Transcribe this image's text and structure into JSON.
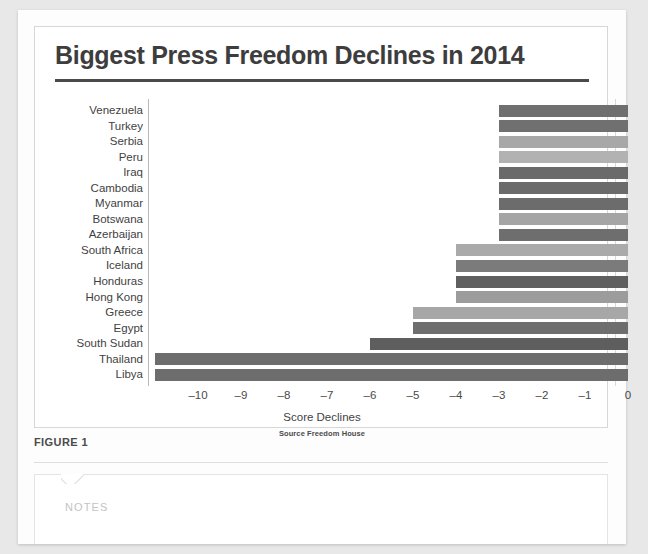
{
  "document": {
    "figure_caption": "FIGURE 1",
    "notes_placeholder": "NOTES"
  },
  "chart_data": {
    "type": "bar",
    "orientation": "horizontal",
    "title": "Biggest Press Freedom Declines in 2014",
    "xlabel": "Score Declines",
    "ylabel": "",
    "source": "Source Freedom House",
    "xlim": [
      -11.2,
      0
    ],
    "xticks": [
      -10,
      -9,
      -8,
      -7,
      -6,
      -5,
      -4,
      -3,
      -2,
      -1,
      0
    ],
    "xticklabels": [
      "–10",
      "–9",
      "–8",
      "–7",
      "–6",
      "–5",
      "–4",
      "–3",
      "–2",
      "–1",
      "0"
    ],
    "grid": false,
    "legend": false,
    "categories": [
      "Venezuela",
      "Turkey",
      "Serbia",
      "Peru",
      "Iraq",
      "Cambodia",
      "Myanmar",
      "Botswana",
      "Azerbaijan",
      "South Africa",
      "Iceland",
      "Honduras",
      "Hong Kong",
      "Greece",
      "Egypt",
      "South Sudan",
      "Thailand",
      "Libya"
    ],
    "values": [
      -3,
      -3,
      -3,
      -3,
      -3,
      -3,
      -3,
      -3,
      -3,
      -4,
      -4,
      -4,
      -4,
      -5,
      -5,
      -6,
      -11,
      -11
    ],
    "bar_colors": [
      "#6f6f6f",
      "#707070",
      "#a8a8a8",
      "#b2b2b2",
      "#6a6a6a",
      "#6b6b6b",
      "#6c6c6c",
      "#a5a5a5",
      "#6e6e6e",
      "#aaaaaa",
      "#7b7b7b",
      "#5f5f5f",
      "#9c9c9c",
      "#a7a7a7",
      "#6e6e6e",
      "#5e5e5e",
      "#6d6d6d",
      "#6d6d6d"
    ],
    "colors": {
      "axis": "#b9b9b9",
      "title_rule": "#4a4a4a",
      "text": "#3f3f3f",
      "card_background": "#ffffff",
      "page_background": "#e8e8e8"
    }
  }
}
